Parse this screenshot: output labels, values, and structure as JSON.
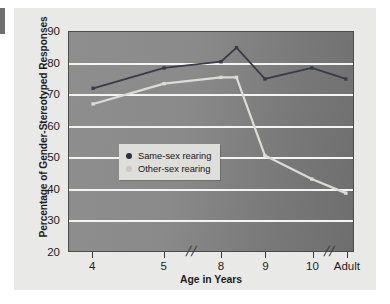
{
  "chart_data": {
    "type": "line",
    "title": "",
    "xlabel": "Age in Years",
    "ylabel": "Percentage of Gender-Stereotyped Responses",
    "categories": [
      "4",
      "5",
      "8",
      "9",
      "10",
      "Adult"
    ],
    "x_tick_labels": [
      "4",
      "5",
      "8",
      "9",
      "10",
      "Adult"
    ],
    "axis_breaks": [
      "between 5 and 8",
      "between 10 and Adult"
    ],
    "axis_break_glyph": "//",
    "y_tick_labels": [
      "20",
      "30",
      "40",
      "50",
      "60",
      "70",
      "80",
      "90"
    ],
    "ylim": [
      20,
      90
    ],
    "y_tick_step": 10,
    "grid": "horizontal",
    "legend_position": "inside-left-middle",
    "series": [
      {
        "name": "Same-sex rearing",
        "color": "#3a3a48",
        "marker": "square",
        "values": [
          72,
          78.5,
          80.5,
          75,
          78.5,
          75
        ],
        "extra_points": [
          {
            "label": "peak",
            "x_offset": 0.32,
            "after_category": "8",
            "value": 85
          }
        ]
      },
      {
        "name": "Other-sex rearing",
        "color": "#dcdcd6",
        "marker": "square",
        "values": [
          67,
          73.5,
          75.5,
          50.5,
          43,
          38.5
        ],
        "extra_points": [
          {
            "label": "peak",
            "x_offset": 0.32,
            "after_category": "8",
            "value": 75.5
          }
        ]
      }
    ]
  },
  "legend": {
    "items": [
      {
        "label": "Same-sex rearing",
        "color": "#2e2e3c"
      },
      {
        "label": "Other-sex rearing",
        "color": "#c9c9c2"
      }
    ]
  },
  "axes": {
    "x_title": "Age in Years",
    "y_title": "Percentage of Gender-Stereotyped Responses"
  },
  "colors": {
    "plot_background": "#848484",
    "gridline": "#f4f4f2",
    "card_background": "#e9e9e7",
    "series_dark": "#3a3a48",
    "series_light": "#dcdcd6",
    "text": "#1d1d1d"
  }
}
